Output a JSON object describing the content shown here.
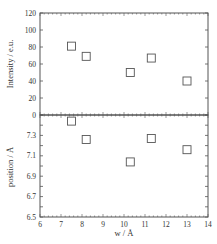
{
  "chart_data": [
    {
      "type": "scatter",
      "panel": "top",
      "title": "",
      "xlabel": "w / Å",
      "ylabel": "Intensity / e.u.",
      "xlim": [
        6,
        14
      ],
      "ylim": [
        0,
        120
      ],
      "yticks": [
        0,
        20,
        40,
        60,
        80,
        100,
        120
      ],
      "ytick_labels": [
        "0",
        "20",
        "40",
        "60",
        "80",
        "100",
        "120"
      ],
      "marker": "open-square",
      "grid": false,
      "series": [
        {
          "name": "Intensity",
          "x": [
            7.5,
            8.2,
            10.3,
            11.3,
            13.0
          ],
          "y": [
            81,
            69,
            50,
            67,
            40
          ]
        }
      ]
    },
    {
      "type": "scatter",
      "panel": "bottom",
      "title": "",
      "xlabel": "w / Å",
      "ylabel": "position / Å",
      "xlim": [
        6,
        14
      ],
      "ylim": [
        6.5,
        7.5
      ],
      "xticks": [
        6,
        7,
        8,
        9,
        10,
        11,
        12,
        13,
        14
      ],
      "xtick_labels": [
        "6",
        "7",
        "8",
        "9",
        "10",
        "11",
        "12",
        "13",
        "14"
      ],
      "yticks": [
        6.5,
        6.7,
        6.9,
        7.1,
        7.3
      ],
      "ytick_labels": [
        "6.5",
        "6.7",
        "6.9",
        "7.1",
        "7.3"
      ],
      "marker": "open-square",
      "grid": false,
      "series": [
        {
          "name": "position",
          "x": [
            7.5,
            8.2,
            10.3,
            11.3,
            13.0
          ],
          "y": [
            7.44,
            7.26,
            7.04,
            7.27,
            7.16
          ]
        }
      ]
    }
  ],
  "labels": {
    "top_ylabel": "Intensity / e.u.",
    "bottom_ylabel": "position / Å",
    "xlabel": "w / Å"
  }
}
